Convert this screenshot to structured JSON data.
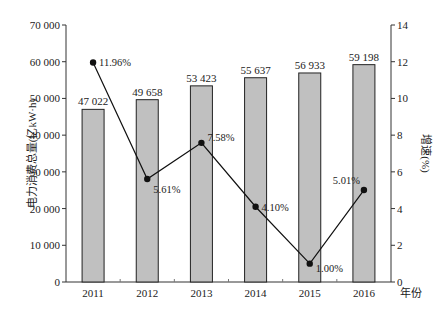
{
  "chart_data": {
    "type": "bar+line",
    "title": "",
    "categories": [
      "2011",
      "2012",
      "2013",
      "2014",
      "2015",
      "2016"
    ],
    "xlabel": "年份",
    "series": [
      {
        "name": "电力消费总量",
        "type": "bar",
        "axis": "left",
        "values": [
          47022,
          49658,
          53423,
          55637,
          56933,
          59198
        ],
        "labels": [
          "47 022",
          "49 658",
          "53 423",
          "55 637",
          "56 933",
          "59 198"
        ],
        "color": "#c0c0c0"
      },
      {
        "name": "增速",
        "type": "line",
        "axis": "right",
        "values": [
          11.96,
          5.61,
          7.58,
          4.1,
          1.0,
          5.01
        ],
        "labels": [
          "11.96%",
          "5.61%",
          "7.58%",
          "4.10%",
          "1.00%",
          "5.01%"
        ],
        "color": "#111111"
      }
    ],
    "y_left": {
      "label": "电力消费总量(亿kW·h)",
      "ylim": [
        0,
        70000
      ],
      "ticks": [
        0,
        10000,
        20000,
        30000,
        40000,
        50000,
        60000,
        70000
      ],
      "tick_labels": [
        "0",
        "10 000",
        "20 000",
        "30 000",
        "40 000",
        "50 000",
        "60 000",
        "70 000"
      ]
    },
    "y_right": {
      "label": "增速(%)",
      "ylim": [
        0,
        14
      ],
      "ticks": [
        0,
        2,
        4,
        6,
        8,
        10,
        12,
        14
      ],
      "tick_labels": [
        "0",
        "2",
        "4",
        "6",
        "8",
        "10",
        "12",
        "14"
      ]
    },
    "grid": false,
    "legend": "none"
  }
}
